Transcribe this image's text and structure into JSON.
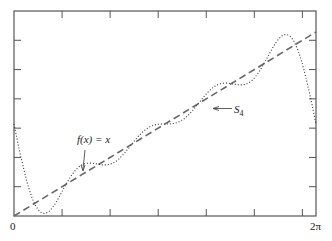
{
  "chart_data": {
    "type": "line",
    "title": "",
    "xlabel": "",
    "ylabel": "",
    "xlim": [
      0,
      6.2832
    ],
    "ylim": [
      0,
      7
    ],
    "x_tick_labels": [
      {
        "value": 0,
        "label": "0"
      },
      {
        "value": 6.2832,
        "label": "2π"
      }
    ],
    "x_ticks": [
      1,
      2,
      3,
      4,
      5,
      6
    ],
    "y_ticks": [
      1,
      2,
      3,
      4,
      5,
      6
    ],
    "grid": false,
    "legend": null,
    "series": [
      {
        "name": "f(x) = x",
        "style": "dashed",
        "formula": "y = x",
        "points": [
          [
            0,
            0
          ],
          [
            6.2832,
            6.2832
          ]
        ]
      },
      {
        "name": "S4",
        "style": "dotted",
        "formula": "S4(x) = π − 2(sin x + sin 2x/2 + sin 3x/3 + sin 4x/4)",
        "constant": 3.14159,
        "sine_coefficients": [
          -2,
          -1,
          -0.6667,
          -0.5
        ],
        "sample_values": [
          {
            "x": 0,
            "y": 3.14
          },
          {
            "x": 1,
            "y": 0.96
          },
          {
            "x": 2,
            "y": 2.38
          },
          {
            "x": 3,
            "y": 3.1
          },
          {
            "x": 4,
            "y": 3.4
          },
          {
            "x": 5,
            "y": 5.53
          },
          {
            "x": 5.5,
            "y": 5.78
          },
          {
            "x": 6.2832,
            "y": 3.14
          }
        ]
      }
    ],
    "annotations": [
      {
        "text": "f(x) = x",
        "points_to": "dashed line near x≈1.4"
      },
      {
        "text": "S4",
        "points_to": "dotted curve near x≈4.1"
      }
    ]
  },
  "labels": {
    "x_min": "0",
    "x_max": "2π",
    "f_label_main": "f(x) = x",
    "s4_label_main": "S",
    "s4_label_sub": "4"
  }
}
